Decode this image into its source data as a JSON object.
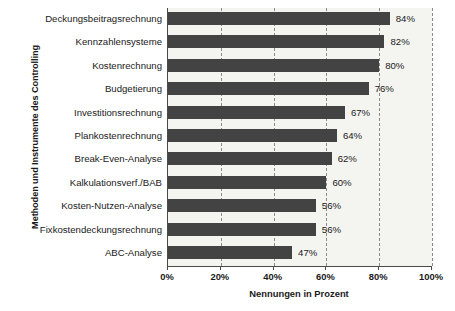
{
  "chart_data": {
    "type": "bar",
    "orientation": "horizontal",
    "title": "",
    "xlabel": "Nennungen in Prozent",
    "ylabel": "Methoden und Instrumente des Controlling",
    "categories": [
      "Deckungsbeitragsrechnung",
      "Kennzahlensysteme",
      "Kostenrechnung",
      "Budgetierung",
      "Investitionsrechnung",
      "Plankostenrechnung",
      "Break-Even-Analyse",
      "Kalkulationsverf./BAB",
      "Kosten-Nutzen-Analyse",
      "Fixkostendeckungsrechnung",
      "ABC-Analyse"
    ],
    "values": [
      84,
      82,
      80,
      76,
      67,
      64,
      62,
      60,
      56,
      56,
      47
    ],
    "value_labels": [
      "84%",
      "82%",
      "80%",
      "76%",
      "67%",
      "64%",
      "62%",
      "60%",
      "56%",
      "56%",
      "47%"
    ],
    "xlim": [
      0,
      100
    ],
    "xticks": [
      0,
      20,
      40,
      60,
      80,
      100
    ],
    "xtick_labels": [
      "0%",
      "20%",
      "40%",
      "60%",
      "80%",
      "100%"
    ],
    "grid": "vertical-dashed",
    "legend": "none",
    "colors": {
      "bar": "#434343",
      "plot_background": "#f4f4f0",
      "axis": "#4a4a4a",
      "gridline": "#8a8a8a",
      "text": "#1a1a1a",
      "figure_background": "#ffffff"
    }
  }
}
